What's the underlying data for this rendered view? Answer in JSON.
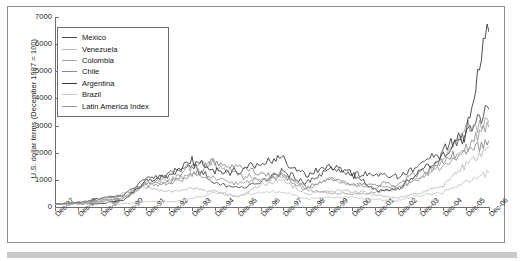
{
  "chart_data": {
    "type": "line",
    "title": "",
    "xlabel": "",
    "ylabel": "U.S. dollar terms (December 1987 = 100)",
    "ylim": [
      0,
      7000
    ],
    "yticks": [
      0,
      1000,
      2000,
      3000,
      4000,
      5000,
      6000,
      7000
    ],
    "grid": false,
    "legend_position": "top-left",
    "categories": [
      "Dec-87",
      "Dec-88",
      "Dec-89",
      "Dec-90",
      "Dec-91",
      "Dec-92",
      "Dec-93",
      "Dec-94",
      "Dec-95",
      "Dec-96",
      "Dec-97",
      "Dec-98",
      "Dec-99",
      "Dec-00",
      "Dec-01",
      "Dec-02",
      "Dec-03",
      "Dec-04",
      "Dec-05",
      "Dec-06"
    ],
    "series": [
      {
        "name": "Mexico",
        "color": "#4a4a4a",
        "values": [
          100,
          150,
          330,
          430,
          1080,
          1180,
          1560,
          900,
          700,
          900,
          1340,
          860,
          1370,
          1180,
          1200,
          1080,
          1520,
          2080,
          2700,
          3600
        ]
      },
      {
        "name": "Venezuela",
        "color": "#b9b9b9",
        "values": [
          100,
          120,
          170,
          520,
          740,
          560,
          700,
          560,
          380,
          800,
          960,
          500,
          560,
          620,
          440,
          330,
          540,
          800,
          1600,
          2200
        ]
      },
      {
        "name": "Colombia",
        "color": "#a2a2a2",
        "values": [
          100,
          140,
          200,
          330,
          900,
          1020,
          1480,
          1620,
          1180,
          1020,
          1100,
          620,
          520,
          480,
          560,
          700,
          1080,
          1800,
          2900,
          3100
        ]
      },
      {
        "name": "Chile",
        "color": "#8a8a8a",
        "values": [
          100,
          180,
          280,
          460,
          860,
          900,
          1220,
          1680,
          1480,
          1220,
          1180,
          760,
          1020,
          880,
          820,
          840,
          1280,
          1700,
          2050,
          2450
        ]
      },
      {
        "name": "Argentina",
        "color": "#3a3a3a",
        "values": [
          100,
          130,
          120,
          240,
          960,
          1180,
          1700,
          1320,
          1300,
          1640,
          1740,
          1180,
          1520,
          1260,
          620,
          640,
          1320,
          1880,
          2800,
          6450
        ]
      },
      {
        "name": "Brazil",
        "color": "#c7c7c7",
        "values": [
          100,
          110,
          180,
          120,
          200,
          180,
          320,
          520,
          420,
          560,
          560,
          300,
          360,
          360,
          280,
          230,
          420,
          560,
          900,
          1250
        ]
      },
      {
        "name": "Latin America Index",
        "color": "#9a9a9a",
        "values": [
          100,
          140,
          230,
          330,
          800,
          860,
          1180,
          1060,
          840,
          1020,
          1160,
          700,
          980,
          880,
          740,
          700,
          1080,
          1500,
          2150,
          2950
        ]
      }
    ]
  },
  "legend": {
    "items": [
      {
        "label": "Mexico"
      },
      {
        "label": "Venezuela"
      },
      {
        "label": "Colombia"
      },
      {
        "label": "Chile"
      },
      {
        "label": "Argentina"
      },
      {
        "label": "Brazil"
      },
      {
        "label": "Latin America Index"
      }
    ]
  }
}
